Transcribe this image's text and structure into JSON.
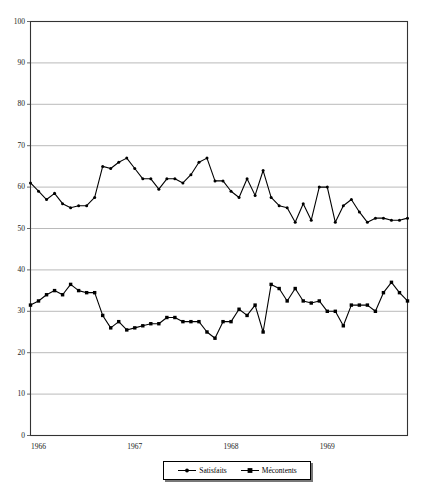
{
  "chart_data": {
    "type": "line",
    "title": "",
    "subtitle": "",
    "xlabel": "",
    "ylabel": "",
    "ylim": [
      0,
      100
    ],
    "xlim": [
      0,
      47
    ],
    "grid": true,
    "grid_axis": "y",
    "legend_position": "bottom-center",
    "x_tick_labels": [
      "1966",
      "1967",
      "1968",
      "1969"
    ],
    "x_tick_positions": [
      0,
      12,
      24,
      36
    ],
    "y_tick_labels": [
      "0",
      "10",
      "20",
      "30",
      "40",
      "50",
      "60",
      "70",
      "80",
      "90",
      "100"
    ],
    "y_tick_values": [
      0,
      10,
      20,
      30,
      40,
      50,
      60,
      70,
      80,
      90,
      100
    ],
    "series": [
      {
        "name": "Satisfaits",
        "marker": "circle",
        "color": "#000000",
        "values": [
          61,
          59,
          57,
          58.5,
          56,
          55,
          55.5,
          55.5,
          57.5,
          65,
          64.5,
          66,
          67,
          64.5,
          62,
          62,
          59.5,
          62,
          62,
          61,
          63,
          66,
          67,
          61.5,
          61.5,
          59,
          57.5,
          62,
          58,
          64,
          57.5,
          55.5,
          55,
          51.5,
          56,
          52,
          60,
          60,
          51.5,
          55.5,
          57,
          54,
          51.5,
          52.5,
          52.5,
          52,
          52,
          52.5
        ]
      },
      {
        "name": "Mécontents",
        "marker": "square",
        "color": "#000000",
        "values": [
          31.5,
          32.5,
          34,
          35,
          34,
          36.5,
          35,
          34.5,
          34.5,
          29,
          26,
          27.5,
          25.5,
          26,
          26.5,
          27,
          27,
          28.5,
          28.5,
          27.5,
          27.5,
          27.5,
          25,
          23.5,
          27.5,
          27.5,
          30.5,
          29,
          31.5,
          25,
          36.5,
          35.5,
          32.5,
          35.5,
          32.5,
          32,
          32.5,
          30,
          30,
          26.5,
          31.5,
          31.5,
          31.5,
          30,
          34.5,
          37,
          34.5,
          32.5
        ]
      }
    ]
  },
  "legend": {
    "entries": [
      {
        "label": "Satisfaits",
        "marker": "circle"
      },
      {
        "label": "Mécontents",
        "marker": "square"
      }
    ]
  },
  "colors": {
    "line": "#000000",
    "grid": "#a8a8a8",
    "frame": "#333333",
    "background": "#ffffff"
  }
}
